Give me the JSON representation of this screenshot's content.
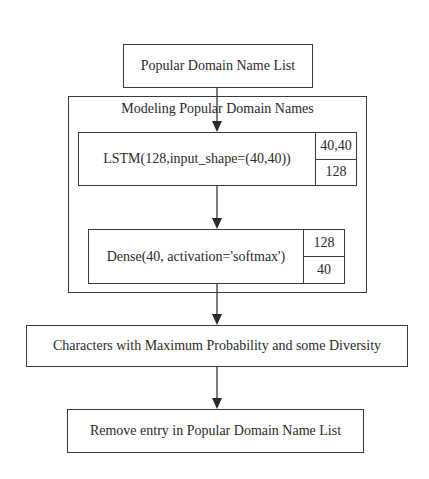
{
  "diagram": {
    "type": "flowchart",
    "nodes": {
      "input_list": {
        "label": "Popular Domain Name List"
      },
      "model_group": {
        "title": "Modeling Popular Domain Names",
        "layers": [
          {
            "label": "LSTM(128,input_shape=(40,40))",
            "input_shape": "40,40",
            "output_shape": "128"
          },
          {
            "label": "Dense(40, activation='softmax')",
            "input_shape": "128",
            "output_shape": "40"
          }
        ]
      },
      "sampling": {
        "label": "Characters with Maximum Probability and some Diversity"
      },
      "remove_entry": {
        "label": "Remove entry in Popular Domain Name List"
      }
    },
    "edges": [
      [
        "input_list",
        "lstm_layer"
      ],
      [
        "lstm_layer",
        "dense_layer"
      ],
      [
        "dense_layer",
        "sampling"
      ],
      [
        "sampling",
        "remove_entry"
      ]
    ],
    "colors": {
      "stroke": "#3a3a3a",
      "text": "#2a2a2a",
      "background": "#ffffff"
    }
  }
}
